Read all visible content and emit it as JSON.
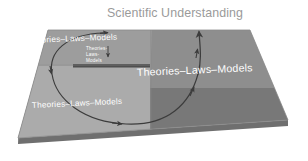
{
  "figure": {
    "title": "Scientific Understanding",
    "quadrant_top_left_label": "Theories–Laws–Models",
    "quadrant_inner_line1": "Theories-",
    "quadrant_inner_line2": "Laws-",
    "quadrant_inner_line3": "Models",
    "quadrant_bottom_left_label": "Theories–Laws–Models",
    "quadrant_right_label": "Theories–Laws–Models",
    "colors": {
      "background": "#ffffff",
      "plane_top_left": "#9d9d9d",
      "plane_bottom_left": "#aeaeae",
      "plane_top_right": "#8e8e8e",
      "plane_bottom_right": "#767676",
      "plane_edge_dark": "#5a5a5a",
      "plane_edge_side": "#6f6f6f",
      "arrow": "#3c3c3c",
      "title_text": "#9a9a9a",
      "label_text": "#ffffff"
    }
  }
}
